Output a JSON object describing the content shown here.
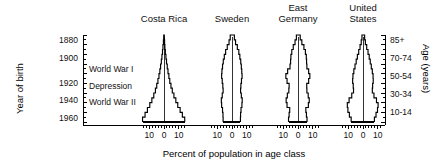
{
  "figure": {
    "caption": "Percent of population in age class",
    "left_axis_title": "Year of birth",
    "right_axis_title": "Age (years)"
  },
  "left_axis": {
    "ticks": [
      {
        "label": "1880",
        "y": 41
      },
      {
        "label": "1900",
        "y": 59
      },
      {
        "label": "1920",
        "y": 84
      },
      {
        "label": "1940",
        "y": 101
      },
      {
        "label": "1960",
        "y": 119
      }
    ]
  },
  "right_axis": {
    "ticks": [
      {
        "label": "85+",
        "y": 41
      },
      {
        "label": "70-74",
        "y": 59
      },
      {
        "label": "50-54",
        "y": 77
      },
      {
        "label": "30-34",
        "y": 95
      },
      {
        "label": "10-14",
        "y": 113
      }
    ]
  },
  "annotations": [
    {
      "label": "World War I",
      "y": 70
    },
    {
      "label": "Depression",
      "y": 87
    },
    {
      "label": "World War II",
      "y": 103
    }
  ],
  "x_tick_labels": [
    "10",
    "0",
    "10"
  ],
  "chart_data": {
    "type": "bar",
    "title": "",
    "subtitle": "",
    "xlabel": "Percent of population in age class",
    "ylabel": "Year of birth",
    "ylabel_right": "Age (years)",
    "orientation": "population-pyramid",
    "grid": false,
    "legend": "none",
    "xlim": [
      -15,
      15
    ],
    "x_ticks": [
      -10,
      0,
      10
    ],
    "x_tick_labels": [
      "10",
      "0",
      "10"
    ],
    "year_ticks": [
      1880,
      1900,
      1920,
      1940,
      1960
    ],
    "age_ticks": [
      "85+",
      "70-74",
      "50-54",
      "30-34",
      "10-14"
    ],
    "age_classes": [
      "0-4",
      "5-9",
      "10-14",
      "15-19",
      "20-24",
      "25-29",
      "30-34",
      "35-39",
      "40-44",
      "45-49",
      "50-54",
      "55-59",
      "60-64",
      "65-69",
      "70-74",
      "75-79",
      "80-84",
      "85+"
    ],
    "annotations": [
      {
        "text": "World War I",
        "year": 1915
      },
      {
        "text": "Depression",
        "year": 1933
      },
      {
        "text": "World War II",
        "year": 1942
      }
    ],
    "panels": [
      {
        "name": "Costa Rica",
        "male": [
          14.5,
          12.8,
          11.2,
          9.6,
          8.2,
          6.9,
          5.8,
          4.9,
          4.1,
          3.4,
          2.8,
          2.3,
          1.8,
          1.4,
          1.0,
          0.7,
          0.4,
          0.2
        ],
        "female": [
          14.0,
          12.4,
          10.9,
          9.3,
          8.0,
          6.7,
          5.6,
          4.7,
          3.9,
          3.3,
          2.7,
          2.2,
          1.7,
          1.3,
          0.9,
          0.6,
          0.4,
          0.2
        ]
      },
      {
        "name": "Sweden",
        "male": [
          6.0,
          6.1,
          6.4,
          7.0,
          7.2,
          6.6,
          6.0,
          6.2,
          6.6,
          7.0,
          6.8,
          6.4,
          5.9,
          5.2,
          4.3,
          3.2,
          2.0,
          1.2
        ],
        "female": [
          5.7,
          5.8,
          6.1,
          6.7,
          6.9,
          6.3,
          5.8,
          6.0,
          6.4,
          6.8,
          6.6,
          6.3,
          5.9,
          5.3,
          4.6,
          3.6,
          2.4,
          1.6
        ]
      },
      {
        "name": "East Germany",
        "male": [
          6.4,
          6.0,
          5.6,
          7.4,
          8.0,
          7.2,
          6.2,
          6.0,
          7.4,
          8.2,
          7.0,
          5.4,
          5.0,
          4.8,
          4.2,
          3.2,
          2.0,
          1.1
        ],
        "female": [
          6.1,
          5.7,
          5.3,
          7.0,
          7.6,
          6.9,
          6.0,
          5.9,
          7.2,
          8.0,
          7.2,
          6.0,
          5.8,
          5.6,
          5.0,
          4.0,
          2.6,
          1.5
        ]
      },
      {
        "name": "United States",
        "male": [
          8.0,
          9.2,
          10.2,
          10.6,
          9.4,
          7.6,
          6.4,
          6.6,
          7.0,
          6.8,
          6.2,
          5.4,
          4.6,
          3.8,
          2.9,
          2.0,
          1.2,
          0.7
        ],
        "female": [
          7.7,
          8.8,
          9.8,
          10.2,
          9.1,
          7.4,
          6.3,
          6.5,
          6.9,
          6.8,
          6.3,
          5.6,
          4.9,
          4.2,
          3.4,
          2.5,
          1.6,
          1.1
        ]
      }
    ]
  },
  "panel_titles": [
    {
      "lines": [
        "Costa Rica"
      ],
      "cx": 164
    },
    {
      "lines": [
        "Sweden"
      ],
      "cx": 232
    },
    {
      "lines": [
        "East",
        "Germany"
      ],
      "cx": 298
    },
    {
      "lines": [
        "United",
        "States"
      ],
      "cx": 363
    }
  ]
}
